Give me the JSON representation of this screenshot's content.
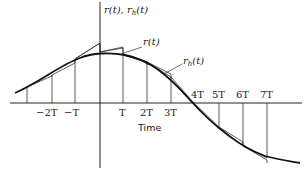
{
  "diagram": {
    "y_axis_label": "r(t), r",
    "y_axis_label_sub": "h",
    "y_axis_label_tail": "(t)",
    "x_axis_label": "Time",
    "curve_label_r": "r(t)",
    "curve_label_rh": "r",
    "curve_label_rh_sub": "h",
    "curve_label_rh_tail": "(t)",
    "ticks": [
      "−2T",
      "−T",
      "T",
      "2T",
      "3T",
      "4T",
      "5T",
      "6T",
      "7T"
    ],
    "colors": {
      "ink": "#222222",
      "background": "#ffffff"
    }
  }
}
